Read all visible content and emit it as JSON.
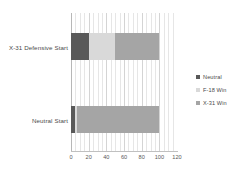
{
  "chart_data": {
    "type": "bar",
    "orientation": "horizontal",
    "stacked": true,
    "title": "",
    "xlabel": "",
    "ylabel": "",
    "categories": [
      "X-31 Defensive Start",
      "Neutral Start"
    ],
    "series": [
      {
        "name": "Neutral",
        "color": "#595959",
        "values": [
          20,
          5
        ]
      },
      {
        "name": "F-18 Win",
        "color": "#d9d9d9",
        "values": [
          30,
          2
        ]
      },
      {
        "name": "X-31 Win",
        "color": "#a5a5a5",
        "values": [
          50,
          93
        ]
      }
    ],
    "xlim": [
      0,
      120
    ],
    "xticks": [
      0,
      20,
      40,
      60,
      80,
      100,
      120
    ],
    "xtick_labels": [
      "0",
      "20",
      "40",
      "60",
      "80",
      "100",
      "120"
    ],
    "minor_gridlines_step": 5,
    "grid": true,
    "legend_position": "right"
  },
  "legend": {
    "items": [
      {
        "label": "Neutral",
        "color": "#595959"
      },
      {
        "label": "F-18 Win",
        "color": "#d9d9d9"
      },
      {
        "label": "X-31 Win",
        "color": "#a5a5a5"
      }
    ]
  },
  "axis": {
    "tick_labels": [
      "0",
      "20",
      "40",
      "60",
      "80",
      "100",
      "120"
    ]
  },
  "categories": {
    "label_0": "X-31 Defensive Start",
    "label_1": "Neutral Start"
  }
}
